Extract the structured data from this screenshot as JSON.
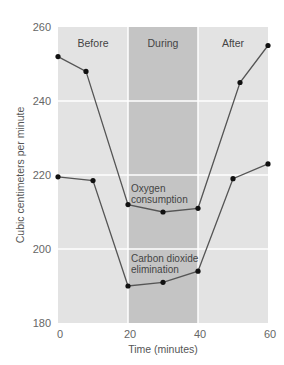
{
  "chart_data": {
    "type": "line",
    "title": "",
    "xlabel": "Time (minutes)",
    "ylabel": "Cubic centimeters per minute",
    "xlim": [
      0,
      60
    ],
    "ylim": [
      180,
      260
    ],
    "x_ticks": [
      0,
      20,
      40,
      60
    ],
    "y_ticks": [
      180,
      200,
      220,
      240,
      260
    ],
    "grid": true,
    "legend": "none (inline annotations)",
    "phases": [
      {
        "label": "Before",
        "x_start": 0,
        "x_end": 20,
        "color": "#e3e3e3"
      },
      {
        "label": "During",
        "x_start": 20,
        "x_end": 40,
        "color": "#c4c4c4"
      },
      {
        "label": "After",
        "x_start": 40,
        "x_end": 60,
        "color": "#e3e3e3"
      }
    ],
    "series": [
      {
        "name": "Oxygen consumption",
        "label_lines": [
          "Oxygen",
          "consumption"
        ],
        "x": [
          0,
          8,
          20,
          30,
          40,
          52,
          60
        ],
        "values": [
          252,
          248,
          212,
          210,
          211,
          245,
          255
        ]
      },
      {
        "name": "Carbon dioxide elimination",
        "label_lines": [
          "Carbon dioxide",
          "elimination"
        ],
        "x": [
          0,
          10,
          20,
          30,
          40,
          50,
          60
        ],
        "values": [
          219.5,
          218.5,
          190,
          191,
          194,
          219,
          223
        ]
      }
    ],
    "colors": {
      "line": "#555555",
      "marker": "#111111",
      "gridline": "#ffffff"
    }
  }
}
